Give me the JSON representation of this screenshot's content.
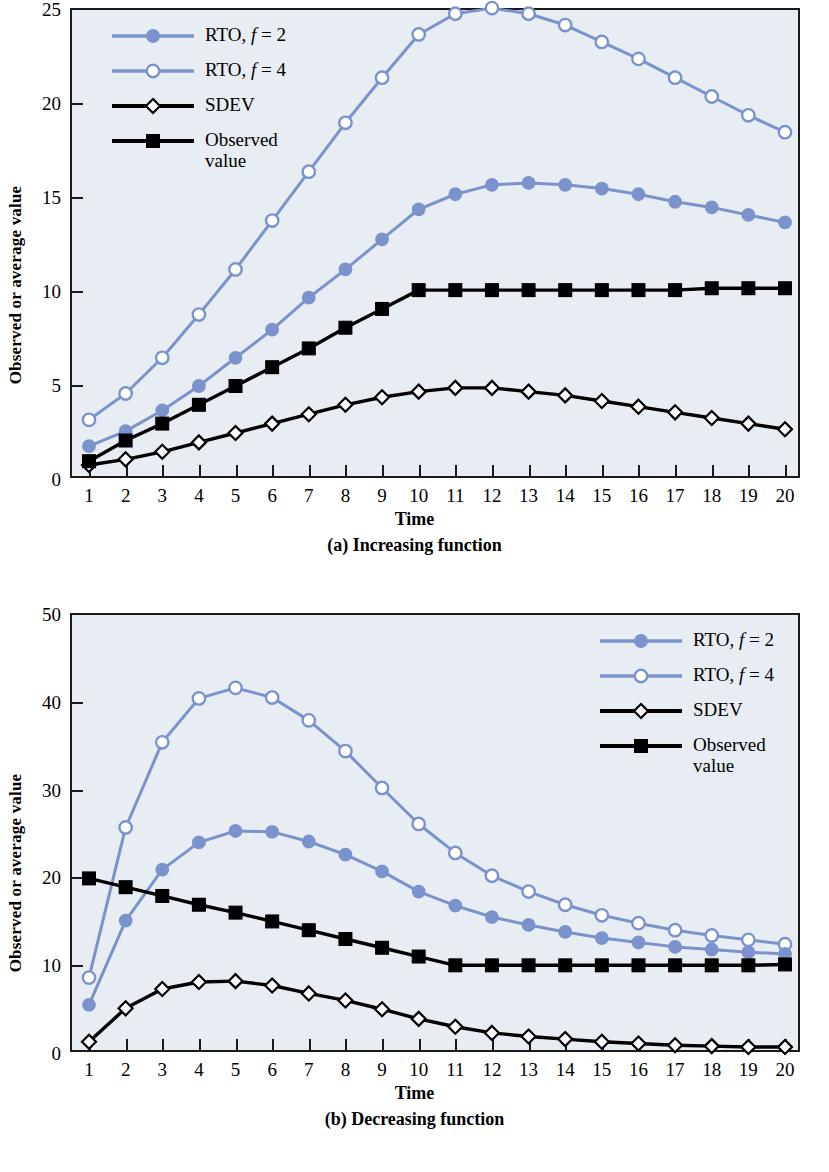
{
  "figure": {
    "panels": [
      {
        "id": "a",
        "caption": "(a) Increasing function",
        "xlabel": "Time",
        "ylabel": "Observed or average value"
      },
      {
        "id": "b",
        "caption": "(b) Decreasing function",
        "xlabel": "Time",
        "ylabel": "Observed or average value"
      }
    ]
  },
  "legend": {
    "items": [
      {
        "label_pre": "RTO,",
        "label_it": "f",
        "label_post": "= 2",
        "marker": "filled-circle",
        "color": "#7b93cc",
        "name": "rto-f2"
      },
      {
        "label_pre": "RTO,",
        "label_it": "f",
        "label_post": "= 4",
        "marker": "open-circle",
        "color": "#7b93cc",
        "name": "rto-f4"
      },
      {
        "label_pre": "SDEV",
        "label_it": "",
        "label_post": "",
        "marker": "open-diamond",
        "color": "#000000",
        "name": "sdev"
      },
      {
        "label_pre": "Observed\nvalue",
        "label_it": "",
        "label_post": "",
        "marker": "filled-square",
        "color": "#000000",
        "name": "observed-value"
      }
    ]
  },
  "colors": {
    "blue": "#7b93cc",
    "black": "#000000",
    "plot_bg": "#e7edf2",
    "page_bg": "#ffffff",
    "axis": "#1a1a1a"
  },
  "chart_data": [
    {
      "type": "line",
      "panel": "a",
      "title": "(a) Increasing function",
      "xlabel": "Time",
      "ylabel": "Observed or average value",
      "x": [
        1,
        2,
        3,
        4,
        5,
        6,
        7,
        8,
        9,
        10,
        11,
        12,
        13,
        14,
        15,
        16,
        17,
        18,
        19,
        20
      ],
      "xlim": [
        1,
        20
      ],
      "ylim": [
        0,
        25
      ],
      "yticks": [
        0,
        5,
        10,
        15,
        20,
        25
      ],
      "xticks": [
        1,
        2,
        3,
        4,
        5,
        6,
        7,
        8,
        9,
        10,
        11,
        12,
        13,
        14,
        15,
        16,
        17,
        18,
        19,
        20
      ],
      "grid": false,
      "legend_position": "top-left",
      "series": [
        {
          "name": "RTO, f = 2",
          "marker": "filled-circle",
          "color": "#7b93cc",
          "values": [
            1.8,
            2.6,
            3.7,
            5.0,
            6.5,
            8.0,
            9.7,
            11.2,
            12.8,
            14.4,
            15.2,
            15.7,
            15.8,
            15.7,
            15.5,
            15.2,
            14.8,
            14.5,
            14.1,
            13.7
          ]
        },
        {
          "name": "RTO, f = 4",
          "marker": "open-circle",
          "color": "#7b93cc",
          "values": [
            3.2,
            4.6,
            6.5,
            8.8,
            11.2,
            13.8,
            16.4,
            19.0,
            21.4,
            23.7,
            24.8,
            25.1,
            24.8,
            24.2,
            23.3,
            22.4,
            21.4,
            20.4,
            19.4,
            18.5
          ]
        },
        {
          "name": "SDEV",
          "marker": "open-diamond",
          "color": "#000000",
          "values": [
            0.8,
            1.1,
            1.5,
            2.0,
            2.5,
            3.0,
            3.5,
            4.0,
            4.4,
            4.7,
            4.9,
            4.9,
            4.7,
            4.5,
            4.2,
            3.9,
            3.6,
            3.3,
            3.0,
            2.7
          ]
        },
        {
          "name": "Observed value",
          "marker": "filled-square",
          "color": "#000000",
          "values": [
            1.0,
            2.1,
            3.0,
            4.0,
            5.0,
            6.0,
            7.0,
            8.1,
            9.1,
            10.1,
            10.1,
            10.1,
            10.1,
            10.1,
            10.1,
            10.1,
            10.1,
            10.2,
            10.2,
            10.2
          ]
        }
      ]
    },
    {
      "type": "line",
      "panel": "b",
      "title": "(b) Decreasing function",
      "xlabel": "Time",
      "ylabel": "Observed or average value",
      "x": [
        1,
        2,
        3,
        4,
        5,
        6,
        7,
        8,
        9,
        10,
        11,
        12,
        13,
        14,
        15,
        16,
        17,
        18,
        19,
        20
      ],
      "xlim": [
        1,
        20
      ],
      "ylim": [
        0,
        50
      ],
      "yticks": [
        0,
        10,
        20,
        30,
        40,
        50
      ],
      "xticks": [
        1,
        2,
        3,
        4,
        5,
        6,
        7,
        8,
        9,
        10,
        11,
        12,
        13,
        14,
        15,
        16,
        17,
        18,
        19,
        20
      ],
      "grid": false,
      "legend_position": "top-right",
      "series": [
        {
          "name": "RTO, f = 2",
          "marker": "filled-circle",
          "color": "#7b93cc",
          "values": [
            5.6,
            15.2,
            21.0,
            24.1,
            25.4,
            25.3,
            24.2,
            22.7,
            20.8,
            18.5,
            16.9,
            15.6,
            14.7,
            13.9,
            13.2,
            12.7,
            12.2,
            11.9,
            11.6,
            11.4
          ]
        },
        {
          "name": "RTO, f = 4",
          "marker": "open-circle",
          "color": "#7b93cc",
          "values": [
            8.7,
            25.8,
            35.5,
            40.5,
            41.7,
            40.6,
            38.0,
            34.5,
            30.3,
            26.2,
            22.9,
            20.3,
            18.5,
            17.0,
            15.8,
            14.9,
            14.1,
            13.5,
            13.0,
            12.5
          ]
        },
        {
          "name": "SDEV",
          "marker": "open-diamond",
          "color": "#000000",
          "values": [
            1.4,
            5.2,
            7.4,
            8.2,
            8.3,
            7.8,
            6.9,
            6.1,
            5.1,
            4.0,
            3.1,
            2.4,
            2.0,
            1.7,
            1.4,
            1.2,
            1.0,
            0.9,
            0.8,
            0.8
          ]
        },
        {
          "name": "Observed value",
          "marker": "filled-square",
          "color": "#000000",
          "values": [
            20.0,
            19.0,
            18.0,
            17.0,
            16.1,
            15.1,
            14.1,
            13.1,
            12.1,
            11.1,
            10.1,
            10.1,
            10.1,
            10.1,
            10.1,
            10.1,
            10.1,
            10.1,
            10.1,
            10.2
          ]
        }
      ]
    }
  ]
}
